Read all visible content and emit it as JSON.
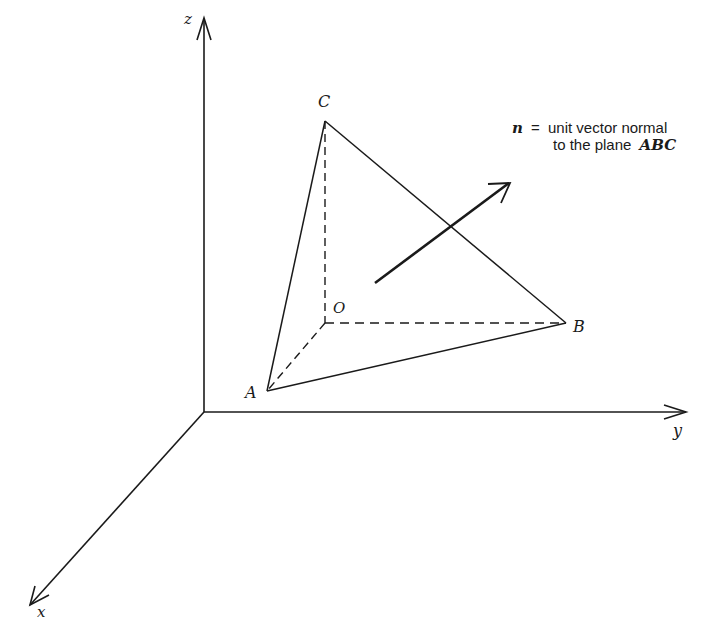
{
  "diagram": {
    "axes": {
      "z_label": "z",
      "y_label": "y",
      "x_label": "x"
    },
    "points": {
      "O": "O",
      "A": "A",
      "B": "B",
      "C": "C"
    },
    "annotation": {
      "symbol": "n",
      "equals": "=",
      "line1": "unit vector normal",
      "line2_prefix": "to the plane",
      "line2_plane": "ABC"
    },
    "colors": {
      "ink": "#1a1a1a",
      "background": "#ffffff"
    }
  }
}
